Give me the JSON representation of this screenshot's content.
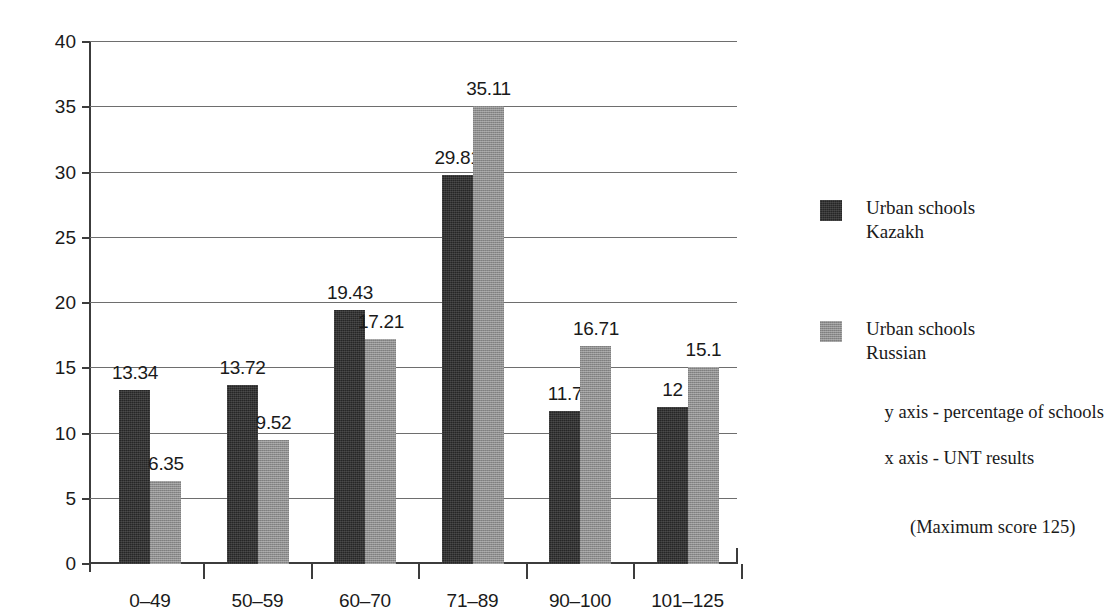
{
  "chart_data": {
    "type": "bar",
    "title": "",
    "subtitle": "",
    "xlabel": "x axis - UNT results (Maximum score 125)",
    "ylabel": "y axis - percentage of schools",
    "categories": [
      "0–49",
      "50–59",
      "60–70",
      "71–89",
      "90–100",
      "101–125"
    ],
    "series": [
      {
        "name": "Urban schools Kazakh",
        "color": "#262626",
        "values": [
          13.34,
          13.72,
          19.43,
          29.81,
          11.7,
          12
        ],
        "value_labels": [
          "13.34",
          "13.72",
          "19.43",
          "29.81",
          "11.7",
          "12"
        ]
      },
      {
        "name": "Urban schools Russian",
        "color": "#8d8d8d",
        "values": [
          6.35,
          9.52,
          17.21,
          35.11,
          16.71,
          15.1
        ],
        "value_labels": [
          "6.35",
          "9.52",
          "17.21",
          "35.11",
          "16.71",
          "15.1"
        ]
      }
    ],
    "ylim": [
      0,
      40
    ],
    "ytick_labels": [
      "0",
      "5",
      "10",
      "15",
      "20",
      "25",
      "30",
      "35",
      "40"
    ],
    "yticks": [
      0,
      5,
      10,
      15,
      20,
      25,
      30,
      35,
      40
    ],
    "grid": true,
    "legend_position": "right"
  },
  "legend": {
    "entries": [
      {
        "line1": "Urban schools",
        "line2": "Kazakh",
        "swatch": "dark"
      },
      {
        "line1": "Urban schools",
        "line2": "Russian",
        "swatch": "gray"
      }
    ]
  },
  "notes": {
    "y_axis": "y axis - percentage of schools",
    "x_axis": "x axis - UNT results",
    "x_axis_detail": "(Maximum score 125)"
  }
}
